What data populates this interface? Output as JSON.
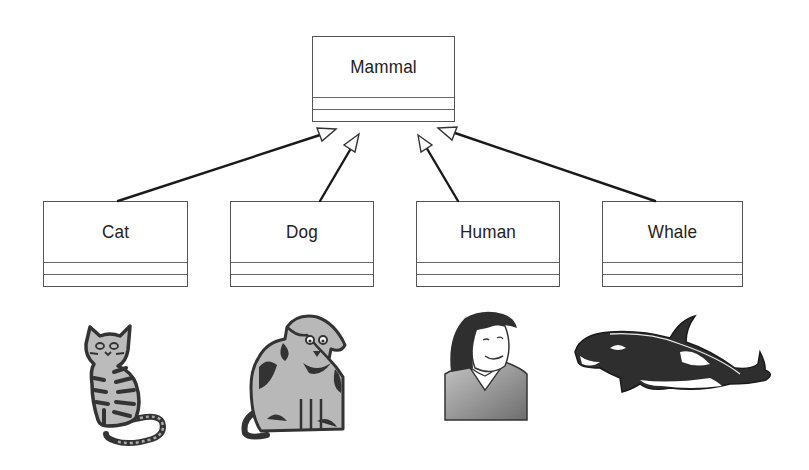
{
  "diagram": {
    "type": "uml-class-inheritance",
    "superclass": {
      "name": "Mammal"
    },
    "subclasses": [
      {
        "name": "Cat",
        "picture": "cat-illustration"
      },
      {
        "name": "Dog",
        "picture": "dog-illustration"
      },
      {
        "name": "Human",
        "picture": "human-illustration"
      },
      {
        "name": "Whale",
        "picture": "whale-illustration"
      }
    ],
    "relationship": "generalization",
    "colors": {
      "line": "#1a1a1a",
      "box_border": "#555555",
      "art_dark": "#333333",
      "art_light": "#b0b0b0"
    }
  }
}
